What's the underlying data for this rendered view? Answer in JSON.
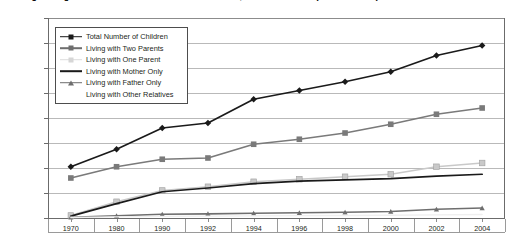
{
  "chart_data": {
    "type": "line",
    "title": "Living Arrangements of Children Under 18 Years Old, 1970 to Present (in thousands)",
    "xlabel": "",
    "ylabel": "",
    "ylim": [
      0,
      16000
    ],
    "ytick_step": 2000,
    "grid": true,
    "legend_position": "top-left-inside",
    "categories": [
      "1970",
      "1980",
      "1990",
      "1992",
      "1994",
      "1996",
      "1998",
      "2000",
      "2002",
      "2004"
    ],
    "ytick_labels": [
      "16,000",
      "14,000",
      "12,000",
      "10,000",
      "8,000",
      "6,000",
      "4,000",
      "2,000",
      "0"
    ],
    "series": [
      {
        "name": "Total Number of Children",
        "marker": "diamond",
        "color": "#1a1a1a",
        "values": [
          4100,
          5500,
          7200,
          7600,
          9500,
          10200,
          10900,
          11700,
          13000,
          13800
        ]
      },
      {
        "name": "Living with Two Parents",
        "marker": "square",
        "color": "#7a7a7a",
        "values": [
          3200,
          4100,
          4700,
          4800,
          5900,
          6300,
          6800,
          7500,
          8300,
          8800
        ]
      },
      {
        "name": "Living with One Parent",
        "marker": "square-light",
        "color": "#c9c9c9",
        "values": [
          200,
          1300,
          2200,
          2500,
          2900,
          3100,
          3300,
          3500,
          4100,
          4400
        ]
      },
      {
        "name": "Living with Mother Only",
        "marker": "none",
        "color": "#1a1a1a",
        "values": [
          150,
          1150,
          2100,
          2400,
          2750,
          2950,
          3050,
          3150,
          3350,
          3500
        ]
      },
      {
        "name": "Living with Father Only",
        "marker": "triangle",
        "color": "#6e6e6e",
        "values": [
          60,
          180,
          300,
          330,
          380,
          420,
          460,
          520,
          700,
          800
        ]
      },
      {
        "name": "Living with Other Relatives",
        "marker": "none",
        "color": "#e8e8e8",
        "values": [
          40,
          90,
          130,
          150,
          170,
          190,
          200,
          220,
          250,
          280
        ]
      }
    ]
  },
  "legend": {
    "items": [
      {
        "label": "Total Number of Children"
      },
      {
        "label": "Living with Two Parents"
      },
      {
        "label": "Living with One Parent"
      },
      {
        "label": "Living with Mother Only"
      },
      {
        "label": "Living with Father Only"
      },
      {
        "label": "Living with Other Relatives"
      }
    ]
  }
}
